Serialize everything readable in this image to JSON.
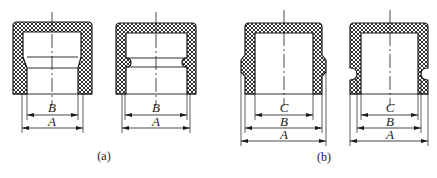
{
  "figure": {
    "panels": [
      {
        "id": "a",
        "caption": "(a)",
        "parts": [
          {
            "name": "socket-with-taper-shoulder",
            "dimensions": [
              {
                "label": "B"
              },
              {
                "label": "A"
              }
            ]
          },
          {
            "name": "socket-with-internal-groove",
            "dimensions": [
              {
                "label": "B"
              },
              {
                "label": "A"
              }
            ]
          }
        ]
      },
      {
        "id": "b",
        "caption": "(b)",
        "parts": [
          {
            "name": "cap-with-external-bulge",
            "dimensions": [
              {
                "label": "C"
              },
              {
                "label": "B"
              },
              {
                "label": "A"
              }
            ]
          },
          {
            "name": "cap-with-external-notch",
            "dimensions": [
              {
                "label": "C"
              },
              {
                "label": "B"
              },
              {
                "label": "A"
              }
            ]
          }
        ]
      }
    ],
    "colors": {
      "line": "#1a1a1a",
      "background": "#ffffff"
    }
  }
}
